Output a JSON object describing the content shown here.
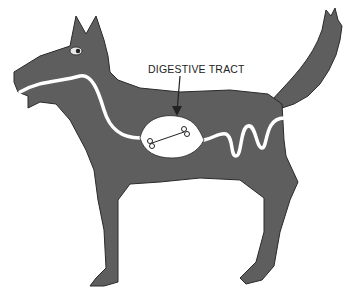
{
  "diagram": {
    "label": "DIGESTIVE TRACT",
    "annotated_item": "bone in stomach",
    "colors": {
      "body": "#5e5e5e",
      "tract": "#ffffff",
      "outline": "#2a2a2a",
      "background": "#ffffff"
    }
  }
}
